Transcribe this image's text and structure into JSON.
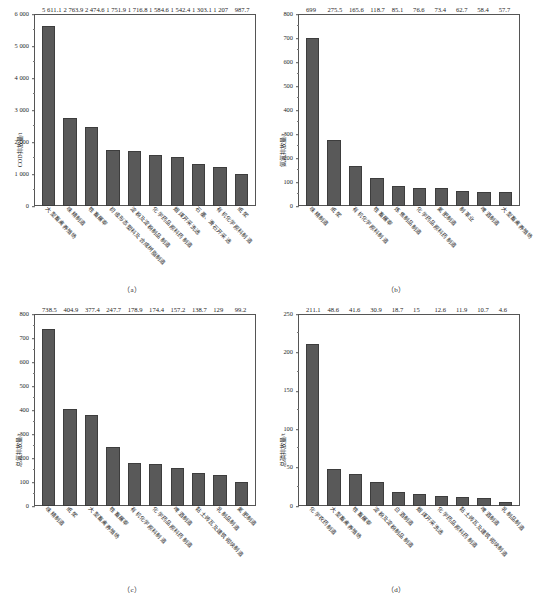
{
  "figure": {
    "caption": ""
  },
  "panels": [
    {
      "caption": "（a）",
      "ylabel": "COD排放量/t",
      "ytick_labels": [
        "0",
        "1 000",
        "2 000",
        "3 000",
        "4 000",
        "5 000",
        "6 000"
      ],
      "chart_data": {
        "type": "bar",
        "title": "",
        "xlabel": "",
        "ylabel": "COD排放量/t",
        "ylim": [
          0,
          6000
        ],
        "ytick_step": 1000,
        "grid": false,
        "legend": "none",
        "bar_color": "#595959",
        "categories": [
          "大型畜禽养殖场",
          "味精制造",
          "牲畜屠宰",
          "初级形态塑料及合成树脂制造",
          "淀粉及淀粉制品制造",
          "化学药品原料药制造",
          "烟煤开采洗选",
          "石墨、滑石开采选",
          "有机化学原料制造",
          "纸浆"
        ],
        "values": [
          5611.1,
          2763.9,
          2474.6,
          1751.9,
          1716.8,
          1584.6,
          1542.4,
          1303.1,
          1207,
          987.7
        ],
        "value_labels": [
          "5 611.1",
          "2 763.9",
          "2 474.6",
          "1 751.9",
          "1 716.8",
          "1 584.6",
          "1 542.4",
          "1 303.1",
          "1 207",
          "987.7"
        ]
      }
    },
    {
      "caption": "（b）",
      "ylabel": "氨氮排放量/t",
      "ytick_labels": [
        "0",
        "100",
        "200",
        "300",
        "400",
        "500",
        "600",
        "700",
        "800"
      ],
      "chart_data": {
        "type": "bar",
        "title": "",
        "xlabel": "",
        "ylabel": "氨氮排放量/t",
        "ylim": [
          0,
          800
        ],
        "ytick_step": 100,
        "grid": false,
        "legend": "none",
        "bar_color": "#595959",
        "categories": [
          "味精制造",
          "纸浆",
          "有机化学原料制造",
          "牲畜屠宰",
          "炼焦制品制造",
          "化学药品原料药制造",
          "氮肥制造",
          "制革业",
          "啤酒制造",
          "大型畜禽养殖场"
        ],
        "values": [
          699,
          275.5,
          165.6,
          118.7,
          85.1,
          76.6,
          73.4,
          62.7,
          58.4,
          57.7
        ],
        "value_labels": [
          "699",
          "275.5",
          "165.6",
          "118.7",
          "85.1",
          "76.6",
          "73.4",
          "62.7",
          "58.4",
          "57.7"
        ]
      }
    },
    {
      "caption": "（c）",
      "ylabel": "总氮排放量/t",
      "ytick_labels": [
        "0",
        "100",
        "200",
        "300",
        "400",
        "500",
        "600",
        "700",
        "800"
      ],
      "chart_data": {
        "type": "bar",
        "title": "",
        "xlabel": "",
        "ylabel": "总氮排放量/t",
        "ylim": [
          0,
          800
        ],
        "ytick_step": 100,
        "grid": false,
        "legend": "none",
        "bar_color": "#595959",
        "categories": [
          "味精制造",
          "纸浆",
          "大型畜禽养殖场",
          "牲畜屠宰",
          "有机化学原料制造",
          "化学药品原料药制造",
          "啤酒制造",
          "黏土砖瓦及建筑砌块制造",
          "乳制品制造",
          "氮肥制造"
        ],
        "values": [
          738.5,
          404.9,
          377.4,
          247.7,
          178.9,
          174.4,
          157.2,
          138.7,
          129,
          99.2
        ],
        "value_labels": [
          "738.5",
          "404.9",
          "377.4",
          "247.7",
          "178.9",
          "174.4",
          "157.2",
          "138.7",
          "129",
          "99.2"
        ]
      }
    },
    {
      "caption": "（d）",
      "ylabel": "总磷排放量/t",
      "ytick_labels": [
        "0",
        "50",
        "100",
        "150",
        "200",
        "250"
      ],
      "chart_data": {
        "type": "bar",
        "title": "",
        "xlabel": "",
        "ylabel": "总磷排放量/t",
        "ylim": [
          0,
          250
        ],
        "ytick_step": 50,
        "grid": false,
        "legend": "none",
        "bar_color": "#595959",
        "categories": [
          "化学农药制造",
          "大型畜禽养殖场",
          "牲畜屠宰",
          "淀粉及淀粉制品制造",
          "白酒制造",
          "烟煤开采洗选",
          "化学药品原料药制造",
          "黏土砖瓦及建筑砌块制造",
          "啤酒制造",
          "乳制品制造"
        ],
        "values": [
          211.1,
          48.6,
          41.6,
          30.9,
          18.7,
          15,
          12.6,
          11.9,
          10.7,
          4.6
        ],
        "value_labels": [
          "211.1",
          "48.6",
          "41.6",
          "30.9",
          "18.7",
          "15",
          "12.6",
          "11.9",
          "10.7",
          "4.6"
        ]
      }
    }
  ]
}
